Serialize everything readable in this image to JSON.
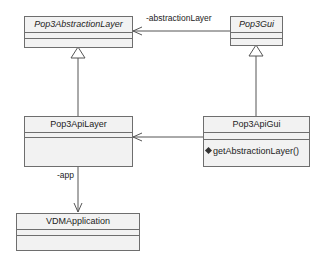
{
  "diagram": {
    "type": "uml-class-diagram",
    "classes": [
      {
        "id": "pop3-abstraction-layer",
        "name": "Pop3AbstractionLayer",
        "abstract": true,
        "attributes": [],
        "operations": []
      },
      {
        "id": "pop3-gui",
        "name": "Pop3Gui",
        "abstract": true,
        "attributes": [],
        "operations": []
      },
      {
        "id": "pop3-api-layer",
        "name": "Pop3ApiLayer",
        "abstract": false,
        "attributes": [],
        "operations": []
      },
      {
        "id": "pop3-api-gui",
        "name": "Pop3ApiGui",
        "abstract": false,
        "attributes": [],
        "operations": [
          {
            "name": "getAbstractionLayer()",
            "icon": "operation-diamond-icon"
          }
        ]
      },
      {
        "id": "vdm-application",
        "name": "VDMApplication",
        "abstract": false,
        "attributes": [],
        "operations": []
      }
    ],
    "relations": [
      {
        "type": "generalization",
        "from": "Pop3ApiLayer",
        "to": "Pop3AbstractionLayer"
      },
      {
        "type": "generalization",
        "from": "Pop3ApiGui",
        "to": "Pop3Gui"
      },
      {
        "type": "association",
        "from": "Pop3Gui",
        "to": "Pop3AbstractionLayer",
        "role": "-abstractionLayer"
      },
      {
        "type": "association",
        "from": "Pop3ApiGui",
        "to": "Pop3ApiLayer",
        "role": ""
      },
      {
        "type": "association",
        "from": "Pop3ApiLayer",
        "to": "VDMApplication",
        "role": "-app"
      }
    ],
    "labels": {
      "abstraction_role": "-abstractionLayer",
      "app_role": "-app"
    },
    "colors": {
      "box_fill": "#f2f2f2",
      "box_border": "#6e6e6e",
      "line": "#555555",
      "text": "#222222"
    }
  }
}
